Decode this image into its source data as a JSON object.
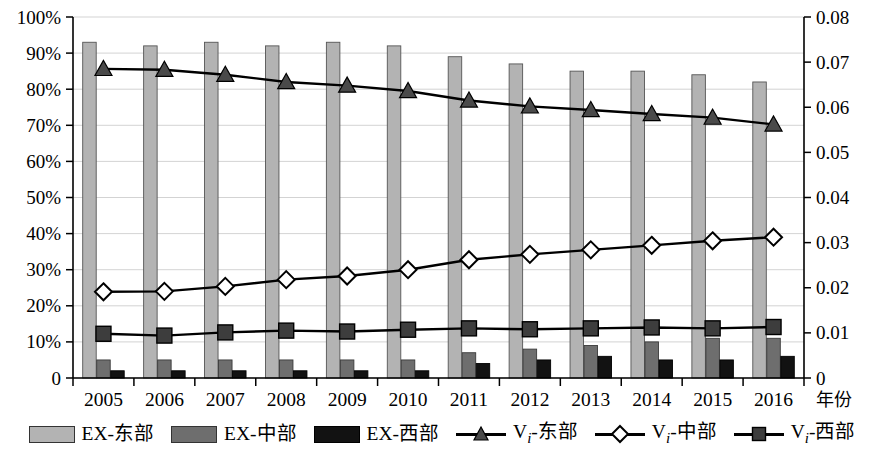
{
  "chart_data": {
    "type": "bar",
    "title": "",
    "subtitle": "",
    "xlabel": "年份",
    "ylabel": "",
    "ylabel_right": "",
    "grid": true,
    "legend_position": "bottom",
    "categories": [
      "2005",
      "2006",
      "2007",
      "2008",
      "2009",
      "2010",
      "2011",
      "2012",
      "2013",
      "2014",
      "2015",
      "2016"
    ],
    "y_left": {
      "min": 0,
      "max": 100,
      "step": 10,
      "unit": "%",
      "ticks": [
        "0",
        "10%",
        "20%",
        "30%",
        "40%",
        "50%",
        "60%",
        "70%",
        "80%",
        "90%",
        "100%"
      ]
    },
    "y_right": {
      "min": 0,
      "max": 0.08,
      "step": 0.01,
      "ticks": [
        "0",
        "0.01",
        "0.02",
        "0.03",
        "0.04",
        "0.05",
        "0.06",
        "0.07",
        "0.08"
      ]
    },
    "series": [
      {
        "name": "EX-东部",
        "kind": "bar",
        "axis": "left",
        "color": "#b3b3b3",
        "values": [
          93,
          92,
          93,
          92,
          93,
          92,
          89,
          87,
          85,
          85,
          84,
          82
        ]
      },
      {
        "name": "EX-中部",
        "kind": "bar",
        "axis": "left",
        "color": "#6e6e6e",
        "values": [
          5,
          5,
          5,
          5,
          5,
          5,
          7,
          8,
          9,
          10,
          11,
          11
        ]
      },
      {
        "name": "EX-西部",
        "kind": "bar",
        "axis": "left",
        "color": "#121212",
        "values": [
          2,
          2,
          2,
          2,
          2,
          2,
          4,
          5,
          6,
          5,
          5,
          6
        ]
      },
      {
        "name": "Vi-东部",
        "kind": "line",
        "axis": "right",
        "marker": "triangle",
        "color": "#000000",
        "values": [
          0.0685,
          0.0683,
          0.0672,
          0.0656,
          0.0648,
          0.0636,
          0.0615,
          0.0602,
          0.0594,
          0.0585,
          0.0577,
          0.0562
        ]
      },
      {
        "name": "Vi-中部",
        "kind": "line",
        "axis": "right",
        "marker": "diamond",
        "color": "#000000",
        "values": [
          0.0191,
          0.0192,
          0.0203,
          0.0218,
          0.0226,
          0.024,
          0.0262,
          0.0274,
          0.0284,
          0.0294,
          0.0304,
          0.0312
        ]
      },
      {
        "name": "Vi-西部",
        "kind": "line",
        "axis": "right",
        "marker": "square",
        "color": "#000000",
        "values": [
          0.0098,
          0.0094,
          0.0101,
          0.0105,
          0.0103,
          0.0107,
          0.011,
          0.0108,
          0.011,
          0.0112,
          0.011,
          0.0113
        ]
      }
    ]
  },
  "legend": {
    "items": [
      {
        "label": "EX-东部",
        "glyph": "swatch-east"
      },
      {
        "label": "EX-中部",
        "glyph": "swatch-middle"
      },
      {
        "label": "EX-西部",
        "glyph": "swatch-west"
      },
      {
        "label_prefix": "V",
        "label_sub": "i",
        "label_suffix": "-东部",
        "glyph": "line-triangle"
      },
      {
        "label_prefix": "V",
        "label_sub": "i",
        "label_suffix": "-中部",
        "glyph": "line-diamond"
      },
      {
        "label_prefix": "V",
        "label_sub": "i",
        "label_suffix": "-西部",
        "glyph": "line-square"
      }
    ]
  }
}
